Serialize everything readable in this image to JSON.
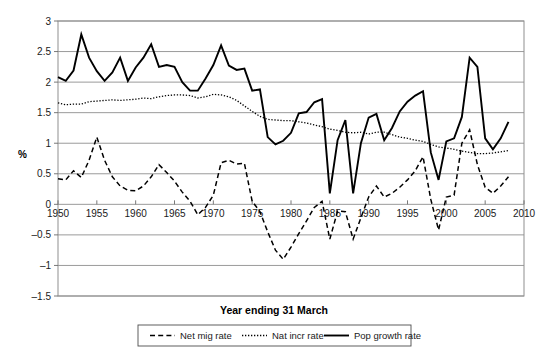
{
  "chart_data": {
    "type": "line",
    "title": "Year ending 31 March",
    "xlabel": "",
    "ylabel": "%",
    "xlim": [
      1950,
      2010
    ],
    "ylim": [
      -1.5,
      3
    ],
    "grid": true,
    "legend_position": "bottom",
    "xticks": [
      1950,
      1955,
      1960,
      1965,
      1970,
      1975,
      1980,
      1985,
      1990,
      1995,
      2000,
      2005,
      2010
    ],
    "yticks": [
      3,
      2.5,
      2,
      1.5,
      1,
      0.5,
      0,
      -0.5,
      -1,
      -1.5
    ],
    "x": [
      1950,
      1951,
      1952,
      1953,
      1954,
      1955,
      1956,
      1957,
      1958,
      1959,
      1960,
      1961,
      1962,
      1963,
      1964,
      1965,
      1966,
      1967,
      1968,
      1969,
      1970,
      1971,
      1972,
      1973,
      1974,
      1975,
      1976,
      1977,
      1978,
      1979,
      1980,
      1981,
      1982,
      1983,
      1984,
      1985,
      1986,
      1987,
      1988,
      1989,
      1990,
      1991,
      1992,
      1993,
      1994,
      1995,
      1996,
      1997,
      1998,
      1999,
      2000,
      2001,
      2002,
      2003,
      2004,
      2005,
      2006,
      2007,
      2008
    ],
    "series": [
      {
        "name": "Net mig rate",
        "style": "dashed",
        "color": "#000000",
        "values": [
          0.42,
          0.4,
          0.55,
          0.44,
          0.72,
          1.1,
          0.72,
          0.45,
          0.3,
          0.23,
          0.22,
          0.3,
          0.45,
          0.65,
          0.52,
          0.38,
          0.2,
          0.05,
          -0.17,
          -0.05,
          0.15,
          0.68,
          0.72,
          0.66,
          0.67,
          0.05,
          -0.12,
          -0.45,
          -0.75,
          -0.9,
          -0.7,
          -0.48,
          -0.27,
          -0.05,
          0.05,
          -0.57,
          -0.11,
          -0.12,
          -0.57,
          -0.22,
          0.12,
          0.3,
          0.12,
          0.18,
          0.28,
          0.4,
          0.55,
          0.78,
          0.08,
          -0.42,
          0.12,
          0.15,
          1.0,
          1.22,
          0.65,
          0.28,
          0.18,
          0.3,
          0.45
        ]
      },
      {
        "name": "Nat incr rate",
        "style": "dotted",
        "color": "#3a3a3a",
        "values": [
          1.66,
          1.63,
          1.64,
          1.64,
          1.68,
          1.69,
          1.7,
          1.71,
          1.7,
          1.71,
          1.72,
          1.74,
          1.73,
          1.76,
          1.78,
          1.79,
          1.79,
          1.78,
          1.74,
          1.76,
          1.8,
          1.79,
          1.76,
          1.7,
          1.61,
          1.52,
          1.44,
          1.39,
          1.38,
          1.37,
          1.37,
          1.35,
          1.33,
          1.3,
          1.27,
          1.23,
          1.21,
          1.18,
          1.17,
          1.18,
          1.15,
          1.18,
          1.18,
          1.14,
          1.1,
          1.08,
          1.05,
          1.03,
          0.98,
          0.94,
          0.92,
          0.9,
          0.87,
          0.85,
          0.83,
          0.83,
          0.84,
          0.86,
          0.88
        ]
      },
      {
        "name": "Pop growth rate",
        "style": "solid",
        "color": "#000000",
        "values": [
          2.08,
          2.02,
          2.19,
          2.78,
          2.4,
          2.18,
          2.02,
          2.16,
          2.4,
          2.02,
          2.24,
          2.4,
          2.62,
          2.25,
          2.28,
          2.25,
          2.0,
          1.86,
          1.86,
          2.06,
          2.28,
          2.6,
          2.27,
          2.2,
          2.22,
          1.86,
          1.88,
          1.1,
          0.98,
          1.04,
          1.17,
          1.49,
          1.51,
          1.67,
          1.72,
          0.18,
          1.05,
          1.38,
          0.18,
          1.0,
          1.42,
          1.48,
          1.05,
          1.25,
          1.52,
          1.68,
          1.78,
          1.85,
          0.85,
          0.4,
          1.03,
          1.08,
          1.43,
          2.4,
          2.25,
          1.08,
          0.9,
          1.08,
          1.35
        ]
      }
    ]
  },
  "legend": {
    "items": [
      {
        "label": "Net mig rate",
        "style": "dashed"
      },
      {
        "label": "Nat incr rate",
        "style": "dotted"
      },
      {
        "label": "Pop growth rate",
        "style": "solid"
      }
    ]
  }
}
